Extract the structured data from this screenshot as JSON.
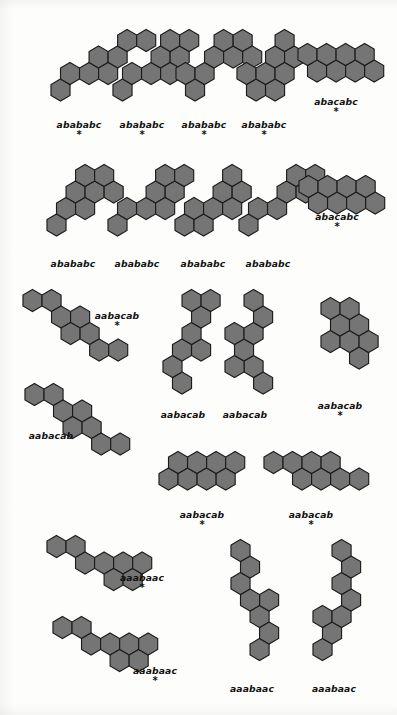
{
  "figure": {
    "kind": "polyhex-catafusene-plate",
    "background_color": "#fdfdfc",
    "hex_fill_color": "#757575",
    "hex_stroke_color": "#1c1c1c",
    "caption_color": "#111111",
    "star_glyph": "*",
    "hex_radius": 11.0
  },
  "structures": [
    {
      "id": "s01",
      "caption": "abababc",
      "starred": true,
      "caption_x": 79,
      "caption_y": 119,
      "origin_x": 48,
      "origin_y": 28,
      "cells": [
        [
          3,
          0
        ],
        [
          2,
          1
        ],
        [
          2,
          2
        ],
        [
          1,
          2
        ],
        [
          1,
          3
        ],
        [
          0,
          4
        ],
        [
          0,
          5
        ],
        [
          2,
          3
        ]
      ]
    },
    {
      "id": "s02",
      "caption": "abababc",
      "starred": true,
      "caption_x": 142,
      "caption_y": 119,
      "origin_x": 110,
      "origin_y": 28,
      "cells": [
        [
          3,
          0
        ],
        [
          2,
          1
        ],
        [
          2,
          2
        ],
        [
          1,
          2
        ],
        [
          1,
          3
        ],
        [
          0,
          3
        ],
        [
          0,
          4
        ],
        [
          2,
          3
        ]
      ]
    },
    {
      "id": "s03",
      "caption": "abababc",
      "starred": true,
      "caption_x": 204,
      "caption_y": 119,
      "origin_x": 173,
      "origin_y": 28,
      "cells": [
        [
          3,
          0
        ],
        [
          2,
          0
        ],
        [
          2,
          1
        ],
        [
          1,
          1
        ],
        [
          1,
          2
        ],
        [
          0,
          2
        ],
        [
          0,
          3
        ],
        [
          1,
          3
        ]
      ]
    },
    {
      "id": "s04",
      "caption": "abababc",
      "starred": true,
      "caption_x": 264,
      "caption_y": 119,
      "origin_x": 234,
      "origin_y": 28,
      "cells": [
        [
          3,
          0
        ],
        [
          3,
          1
        ],
        [
          2,
          0
        ],
        [
          2,
          1
        ],
        [
          1,
          1
        ],
        [
          1,
          2
        ],
        [
          0,
          2
        ],
        [
          2,
          2
        ]
      ]
    },
    {
      "id": "s05",
      "caption": "abacabc",
      "starred": true,
      "caption_x": 336,
      "caption_y": 96,
      "origin_x": 295,
      "origin_y": 42,
      "cells": [
        [
          1,
          0
        ],
        [
          1,
          1
        ],
        [
          1,
          2
        ],
        [
          1,
          3
        ],
        [
          0,
          0
        ],
        [
          0,
          1
        ],
        [
          0,
          2
        ],
        [
          0,
          3
        ]
      ]
    },
    {
      "id": "s06",
      "caption": "abababc",
      "starred": false,
      "caption_x": 73,
      "caption_y": 258,
      "origin_x": 44,
      "origin_y": 163,
      "cells": [
        [
          3,
          0
        ],
        [
          2,
          1
        ],
        [
          1,
          1
        ],
        [
          1,
          2
        ],
        [
          0,
          2
        ],
        [
          0,
          3
        ],
        [
          1,
          3
        ],
        [
          2,
          2
        ]
      ]
    },
    {
      "id": "s07",
      "caption": "abababc",
      "starred": false,
      "caption_x": 137,
      "caption_y": 258,
      "origin_x": 105,
      "origin_y": 163,
      "cells": [
        [
          3,
          0
        ],
        [
          2,
          1
        ],
        [
          2,
          2
        ],
        [
          1,
          2
        ],
        [
          1,
          3
        ],
        [
          0,
          3
        ],
        [
          0,
          4
        ],
        [
          2,
          3
        ]
      ]
    },
    {
      "id": "s08",
      "caption": "abababc",
      "starred": false,
      "caption_x": 203,
      "caption_y": 258,
      "origin_x": 172,
      "origin_y": 163,
      "cells": [
        [
          3,
          0
        ],
        [
          3,
          1
        ],
        [
          2,
          1
        ],
        [
          2,
          2
        ],
        [
          1,
          2
        ],
        [
          1,
          3
        ],
        [
          0,
          3
        ],
        [
          2,
          3
        ]
      ]
    },
    {
      "id": "s09",
      "caption": "abababc",
      "starred": false,
      "caption_x": 268,
      "caption_y": 258,
      "origin_x": 236,
      "origin_y": 163,
      "cells": [
        [
          3,
          0
        ],
        [
          2,
          1
        ],
        [
          2,
          2
        ],
        [
          1,
          2
        ],
        [
          1,
          3
        ],
        [
          0,
          3
        ],
        [
          0,
          4
        ],
        [
          1,
          4
        ]
      ]
    },
    {
      "id": "s10",
      "caption": "abacabc",
      "starred": true,
      "caption_x": 337,
      "caption_y": 211,
      "origin_x": 296,
      "origin_y": 174,
      "cells": [
        [
          1,
          0
        ],
        [
          1,
          1
        ],
        [
          1,
          2
        ],
        [
          1,
          3
        ],
        [
          0,
          0
        ],
        [
          0,
          1
        ],
        [
          0,
          2
        ],
        [
          0,
          3
        ]
      ]
    },
    {
      "id": "s11",
      "caption": "aabacab",
      "starred": true,
      "caption_x": 117,
      "caption_y": 310,
      "origin_x": 20,
      "origin_y": 288,
      "cells": [
        [
          0,
          0
        ],
        [
          0,
          1
        ],
        [
          1,
          1
        ],
        [
          1,
          2
        ],
        [
          2,
          2
        ],
        [
          2,
          3
        ],
        [
          3,
          3
        ],
        [
          3,
          4
        ]
      ]
    },
    {
      "id": "s12",
      "caption": "aabacab",
      "starred": false,
      "caption_x": 183,
      "caption_y": 409,
      "origin_x": 160,
      "origin_y": 288,
      "cells": [
        [
          5,
          0
        ],
        [
          4,
          0
        ],
        [
          3,
          0
        ],
        [
          3,
          1
        ],
        [
          2,
          1
        ],
        [
          1,
          1
        ],
        [
          0,
          1
        ],
        [
          0,
          2
        ]
      ]
    },
    {
      "id": "s13",
      "caption": "aabacab",
      "starred": false,
      "caption_x": 245,
      "caption_y": 409,
      "origin_x": 222,
      "origin_y": 288,
      "cells": [
        [
          5,
          1
        ],
        [
          4,
          1
        ],
        [
          4,
          0
        ],
        [
          3,
          0
        ],
        [
          2,
          0
        ],
        [
          2,
          1
        ],
        [
          1,
          1
        ],
        [
          0,
          1
        ]
      ]
    },
    {
      "id": "s14",
      "caption": "aabacab",
      "starred": true,
      "caption_x": 340,
      "caption_y": 400,
      "origin_x": 318,
      "origin_y": 296,
      "cells": [
        [
          3,
          1
        ],
        [
          2,
          0
        ],
        [
          2,
          1
        ],
        [
          1,
          0
        ],
        [
          1,
          1
        ],
        [
          0,
          0
        ],
        [
          0,
          1
        ],
        [
          2,
          2
        ]
      ]
    },
    {
      "id": "s15",
      "caption": "aabacab",
      "starred": false,
      "caption_x": 51,
      "caption_y": 430,
      "origin_x": 22,
      "origin_y": 382,
      "cells": [
        [
          0,
          0
        ],
        [
          0,
          1
        ],
        [
          1,
          1
        ],
        [
          1,
          2
        ],
        [
          2,
          2
        ],
        [
          2,
          3
        ],
        [
          3,
          3
        ],
        [
          3,
          4
        ]
      ]
    },
    {
      "id": "s16",
      "caption": "aabacab",
      "starred": true,
      "caption_x": 202,
      "caption_y": 509,
      "origin_x": 156,
      "origin_y": 450,
      "cells": [
        [
          1,
          0
        ],
        [
          1,
          1
        ],
        [
          0,
          1
        ],
        [
          0,
          2
        ],
        [
          1,
          2
        ],
        [
          1,
          3
        ],
        [
          0,
          3
        ],
        [
          0,
          4
        ]
      ]
    },
    {
      "id": "s17",
      "caption": "aabacab",
      "starred": true,
      "caption_x": 311,
      "caption_y": 509,
      "origin_x": 261,
      "origin_y": 450,
      "cells": [
        [
          0,
          0
        ],
        [
          0,
          1
        ],
        [
          1,
          1
        ],
        [
          1,
          2
        ],
        [
          0,
          2
        ],
        [
          0,
          3
        ],
        [
          1,
          3
        ],
        [
          1,
          4
        ]
      ]
    },
    {
      "id": "s18",
      "caption": "aaabaac",
      "starred": true,
      "caption_x": 142,
      "caption_y": 572,
      "origin_x": 44,
      "origin_y": 534,
      "cells": [
        [
          0,
          0
        ],
        [
          0,
          1
        ],
        [
          1,
          1
        ],
        [
          1,
          2
        ],
        [
          1,
          3
        ],
        [
          2,
          3
        ],
        [
          2,
          4
        ],
        [
          1,
          4
        ]
      ]
    },
    {
      "id": "s19",
      "caption": "aaabaac",
      "starred": true,
      "caption_x": 155,
      "caption_y": 665,
      "origin_x": 50,
      "origin_y": 615,
      "cells": [
        [
          0,
          0
        ],
        [
          0,
          1
        ],
        [
          1,
          1
        ],
        [
          1,
          2
        ],
        [
          1,
          3
        ],
        [
          2,
          3
        ],
        [
          2,
          4
        ],
        [
          1,
          4
        ]
      ]
    },
    {
      "id": "s20",
      "caption": "aaabaac",
      "starred": false,
      "caption_x": 252,
      "caption_y": 683,
      "origin_x": 228,
      "origin_y": 538,
      "cells": [
        [
          6,
          1
        ],
        [
          5,
          1
        ],
        [
          4,
          1
        ],
        [
          3,
          1
        ],
        [
          3,
          0
        ],
        [
          2,
          0
        ],
        [
          1,
          0
        ],
        [
          0,
          0
        ]
      ]
    },
    {
      "id": "s21",
      "caption": "aaabaac",
      "starred": false,
      "caption_x": 334,
      "caption_y": 683,
      "origin_x": 310,
      "origin_y": 538,
      "cells": [
        [
          6,
          0
        ],
        [
          5,
          0
        ],
        [
          4,
          0
        ],
        [
          4,
          1
        ],
        [
          3,
          1
        ],
        [
          2,
          1
        ],
        [
          1,
          1
        ],
        [
          0,
          1
        ]
      ]
    }
  ]
}
